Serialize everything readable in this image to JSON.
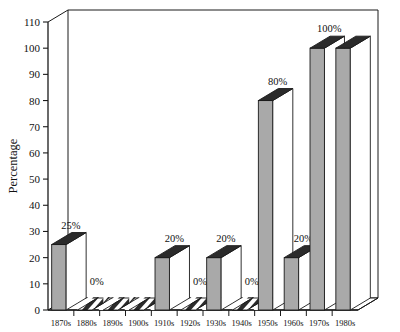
{
  "chart_data": {
    "type": "bar",
    "title": "",
    "subtitle": "",
    "xlabel": "",
    "ylabel": "Percentage",
    "categories": [
      "1870s",
      "1880s",
      "1890s",
      "1900s",
      "1910s",
      "1920s",
      "1930s",
      "1940s",
      "1950s",
      "1960s",
      "1970s",
      "1980s"
    ],
    "values": [
      25,
      0,
      0,
      0,
      20,
      0,
      20,
      0,
      80,
      20,
      100,
      100
    ],
    "data_labels": [
      "25%",
      "0%",
      "",
      "",
      "20%",
      "0%",
      "20%",
      "0%",
      "80%",
      "20%",
      "100%",
      ""
    ],
    "ylim": [
      0,
      110
    ],
    "ytick_labels": [
      "0",
      "10",
      "20",
      "30",
      "40",
      "50",
      "60",
      "70",
      "80",
      "90",
      "100",
      "110"
    ],
    "ytick_values": [
      0,
      10,
      20,
      30,
      40,
      50,
      60,
      70,
      80,
      90,
      100,
      110
    ],
    "grid": false,
    "legend": "none",
    "style": "3d-column",
    "colors": {
      "bar_face": "#a9a9a9",
      "bar_top": "#2b2b2b",
      "bar_side": "#ffffff",
      "zero_bar": "#2b2b2b",
      "zero_bar_stripe": "#ffffff",
      "axis": "#1a1a1a",
      "background": "#ffffff"
    }
  },
  "axes": {
    "y_title": "Percentage"
  }
}
